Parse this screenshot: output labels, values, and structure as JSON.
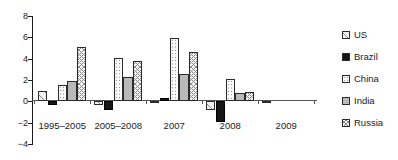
{
  "chart_data": {
    "type": "bar",
    "title": "",
    "subtitle": "",
    "xlabel": "",
    "ylabel": "",
    "categories": [
      "1995–2005",
      "2005–2008",
      "2007",
      "2008",
      "2009"
    ],
    "series": [
      {
        "name": "US",
        "values": [
          1.0,
          -0.3,
          -0.1,
          -0.8,
          -0.2
        ],
        "pattern": "diagonal-hatch",
        "color": "#f2f2f2"
      },
      {
        "name": "Brazil",
        "values": [
          -0.3,
          -0.8,
          0.3,
          -1.9,
          0.0
        ],
        "pattern": "solid-black",
        "color": "#151515"
      },
      {
        "name": "China",
        "values": [
          1.5,
          4.1,
          5.9,
          2.1,
          0.0
        ],
        "pattern": "dotted",
        "color": "#fbfbfb"
      },
      {
        "name": "India",
        "values": [
          1.9,
          2.3,
          2.6,
          0.75,
          0.0
        ],
        "pattern": "solid-gray",
        "color": "#b9b9b9"
      },
      {
        "name": "Russia",
        "values": [
          5.1,
          3.8,
          4.6,
          0.85,
          0.0
        ],
        "pattern": "cross-hatch",
        "color": "#f7f7f7"
      }
    ],
    "ylim": [
      -4,
      8
    ],
    "yticks": [
      8,
      6,
      4,
      2,
      0,
      -2,
      -4
    ],
    "ytick_labels": [
      "8",
      "6",
      "4",
      "2",
      "0",
      "−2",
      "−4"
    ],
    "grid": false,
    "legend_position": "right",
    "legend_entries": [
      "US",
      "Brazil",
      "China",
      "India",
      "Russia"
    ]
  }
}
